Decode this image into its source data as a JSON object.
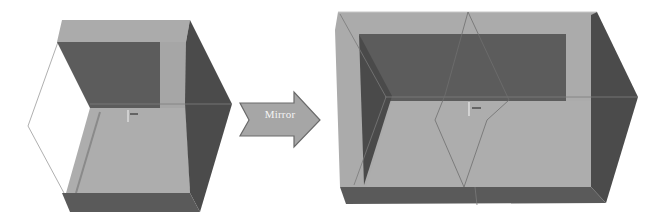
{
  "diagram": {
    "operation_label": "Mirror",
    "before": {
      "description": "Half shell box (one open side) before mirror operation"
    },
    "after": {
      "description": "Full shell box after mirroring about the center plane"
    },
    "colors": {
      "light_face": "#a9a9a9",
      "dark_face": "#5a5a5a",
      "side_face": "#4a4a4a",
      "edge_line": "#8c8c8c",
      "arrow_fill": "#a6a6a6",
      "arrow_stroke": "#6a6a6a",
      "arrow_text": "#f4f4f4",
      "background": "#ffffff"
    }
  }
}
